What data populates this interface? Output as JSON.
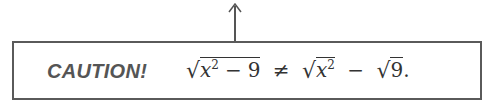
{
  "callout": {
    "label": "CAUTION!",
    "expression": {
      "lhs": {
        "radicand_var": "x",
        "radicand_exp": "2",
        "minus": "−",
        "radicand_const": "9"
      },
      "relation": "≠",
      "rhs_first": {
        "radicand_var": "x",
        "radicand_exp": "2"
      },
      "rhs_minus": "−",
      "rhs_second": {
        "radicand_const": "9"
      },
      "end": "."
    },
    "radical_symbol": "√"
  },
  "colors": {
    "border": "#5a5a5a",
    "label": "#555555",
    "text": "#333333"
  }
}
